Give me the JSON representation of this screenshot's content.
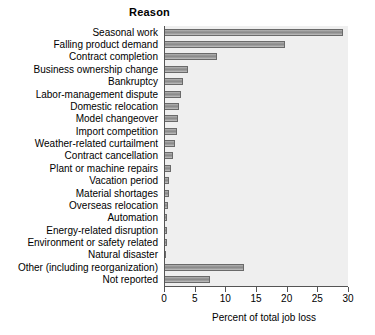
{
  "chart_data": {
    "type": "bar",
    "orientation": "horizontal",
    "title": "Reason",
    "xlabel": "Percent of total job loss",
    "ylabel": "",
    "xlim": [
      0,
      30
    ],
    "xticks": [
      0,
      5,
      10,
      15,
      20,
      25,
      30
    ],
    "xtick_labels": [
      "0",
      "5",
      "10",
      "15",
      "20",
      "25",
      "30"
    ],
    "grid": false,
    "legend": null,
    "categories": [
      "Seasonal work",
      "Falling product demand",
      "Contract completion",
      "Business ownership change",
      "Bankruptcy",
      "Labor-management dispute",
      "Domestic relocation",
      "Model changeover",
      "Import competition",
      "Weather-related curtailment",
      "Contract cancellation",
      "Plant or machine repairs",
      "Vacation period",
      "Material shortages",
      "Overseas relocation",
      "Automation",
      "Energy-related disruption",
      "Environment or safety related",
      "Natural disaster",
      "Other (including reorganization)",
      "Not reported"
    ],
    "values": [
      29.0,
      19.6,
      8.5,
      3.8,
      3.0,
      2.6,
      2.3,
      2.1,
      2.0,
      1.6,
      1.3,
      1.0,
      0.7,
      0.6,
      0.5,
      0.4,
      0.4,
      0.3,
      0.2,
      12.8,
      7.4
    ],
    "bar_color": "#9a9a9a",
    "bar_border_color": "#6a6a6a",
    "plot_background": "#efefef",
    "axis_color": "#555555",
    "text_color": "#000000"
  }
}
